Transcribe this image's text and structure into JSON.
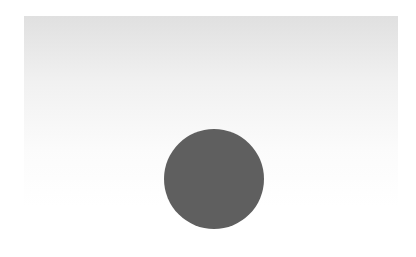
{
  "canvas": {
    "width": 416,
    "height": 257,
    "background": "#ffffff"
  },
  "shapes": {
    "gradient_rect": {
      "type": "rectangle",
      "x": 24,
      "y": 16,
      "width": 374,
      "height": 190,
      "fill_top": "#e0e0e0",
      "fill_bottom": "#ffffff"
    },
    "circle": {
      "type": "circle",
      "cx": 214,
      "cy": 179,
      "radius": 50,
      "fill": "#5f5f5f"
    }
  }
}
